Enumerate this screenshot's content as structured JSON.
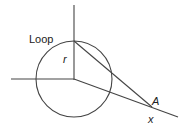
{
  "diagram": {
    "labels": {
      "loop": "Loop",
      "radius": "r",
      "point": "A",
      "distance": "x"
    },
    "colors": {
      "stroke": "#444444",
      "text": "#222222",
      "background": "#ffffff"
    },
    "geometry": {
      "center": [
        74,
        79
      ],
      "radius": 38,
      "vertical_axis": [
        [
          74,
          5
        ],
        [
          74,
          80
        ]
      ],
      "horizontal_axis": [
        [
          11,
          79
        ],
        [
          74,
          79
        ]
      ],
      "tangent_line": [
        [
          74,
          41
        ],
        [
          152,
          107
        ]
      ],
      "x_axis_line": [
        [
          74,
          79
        ],
        [
          178,
          117
        ]
      ]
    }
  }
}
